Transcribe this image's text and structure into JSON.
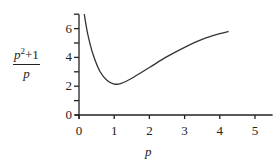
{
  "chart_data": {
    "type": "line",
    "title": "",
    "xlabel": "p",
    "ylabel": "(p^2+1)/p",
    "ylabel_parts": {
      "numerator": "p²+1",
      "denominator": "p"
    },
    "xlim": [
      0,
      5.5
    ],
    "ylim": [
      0,
      7
    ],
    "grid": false,
    "legend": null,
    "x_ticks": [
      "0",
      "1",
      "2",
      "3",
      "4",
      "5"
    ],
    "y_ticks": [
      "0",
      "2",
      "4",
      "6"
    ],
    "y_minor_ticks": [
      1,
      3,
      5,
      7
    ],
    "series": [
      {
        "name": "(p^2+1)/p",
        "x": [
          0.15,
          0.25,
          0.4,
          0.6,
          0.8,
          1.0,
          1.2,
          1.5,
          2.0,
          2.5,
          3.0,
          3.5,
          4.0,
          4.25
        ],
        "values": [
          7.0,
          5.6,
          4.2,
          3.0,
          2.4,
          2.15,
          2.2,
          2.55,
          3.3,
          4.05,
          4.7,
          5.25,
          5.65,
          5.8
        ]
      }
    ],
    "annotations": []
  },
  "labels": {
    "xlabel": "p",
    "ylabel_num": "p",
    "ylabel_sup": "2",
    "ylabel_rest": "+1",
    "ylabel_den": "p",
    "xt": [
      "0",
      "1",
      "2",
      "3",
      "4",
      "5"
    ],
    "yt": [
      "0",
      "2",
      "4",
      "6"
    ]
  }
}
